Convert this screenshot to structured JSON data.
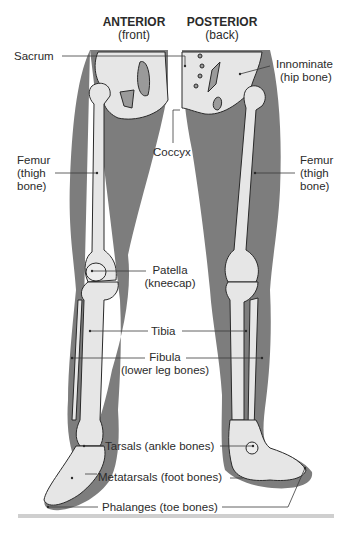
{
  "headers": {
    "anterior": {
      "title": "ANTERIOR",
      "sub": "(front)"
    },
    "posterior": {
      "title": "POSTERIOR",
      "sub": "(back)"
    }
  },
  "labels": {
    "sacrum": "Sacrum",
    "innominate": {
      "line1": "Innominate",
      "line2": "(hip bone)"
    },
    "coccyx": "Coccyx",
    "femur_left": {
      "line1": "Femur",
      "line2": "(thigh",
      "line3": "bone)"
    },
    "femur_right": {
      "line1": "Femur",
      "line2": "(thigh",
      "line3": "bone)"
    },
    "patella": {
      "line1": "Patella",
      "line2": "(kneecap)"
    },
    "tibia": "Tibia",
    "fibula": {
      "line1": "Fibula",
      "line2": "(lower leg bones)"
    },
    "tarsals": "Tarsals (ankle bones)",
    "metatarsals": "Metatarsals (foot bones)",
    "phalanges": "Phalanges (toe bones)"
  },
  "colors": {
    "silhouette": "#7d7d7d",
    "bone": "#e6e6e6",
    "bone_outline": "#2a2a2a",
    "leader": "#3a3a3a",
    "footer_bar": "#cfcfcf"
  }
}
